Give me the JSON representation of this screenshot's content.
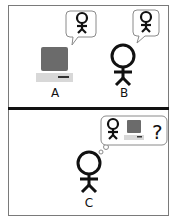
{
  "diagram": {
    "panels": [
      {
        "id": "top",
        "agents": [
          {
            "label": "A",
            "type": "computer",
            "thought_bubble": "speech",
            "bubble_content": [
              "person"
            ]
          },
          {
            "label": "B",
            "type": "person",
            "thought_bubble": "speech",
            "bubble_content": [
              "person"
            ]
          }
        ]
      },
      {
        "id": "bottom",
        "agents": [
          {
            "label": "C",
            "type": "person",
            "thought_bubble": "thought",
            "bubble_content": [
              "person",
              "computer",
              "?"
            ]
          }
        ]
      }
    ],
    "question_mark": "?",
    "colors": {
      "stroke": "#111111",
      "frame": "#7a7a7a",
      "screen": "#6b6b6b",
      "base": "#d8d8d8",
      "bubble_border": "#8a8a8a"
    }
  }
}
